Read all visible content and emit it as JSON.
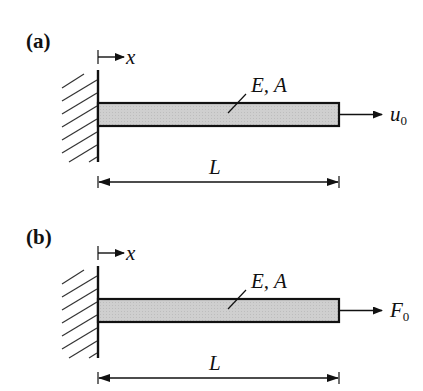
{
  "figure": {
    "panels": [
      {
        "id": "a",
        "label": "(a)",
        "axis_label": "x",
        "material_label": "E, A",
        "length_label": "L",
        "load": {
          "type": "prescribed-displacement",
          "symbol": "u",
          "subscript": "0"
        }
      },
      {
        "id": "b",
        "label": "(b)",
        "axis_label": "x",
        "material_label": "E, A",
        "length_label": "L",
        "load": {
          "type": "point-force",
          "symbol": "F",
          "subscript": "0"
        }
      }
    ],
    "colors": {
      "line": "#111111",
      "bar_fill": "#c8c8c8",
      "hatch": "#333333",
      "background": "#ffffff"
    }
  }
}
